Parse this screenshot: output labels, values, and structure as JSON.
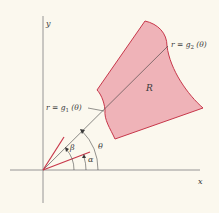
{
  "diagram": {
    "type": "polar-region",
    "colors": {
      "background": "#fbf8ee",
      "region_fill": "#efb3b8",
      "region_stroke": "#c7374a",
      "axis": "#8a8a8a",
      "ray": "#3a3a3a",
      "bound_ray": "#c7374a",
      "text": "#3a3a3a"
    },
    "axes": {
      "x_label": "x",
      "y_label": "y"
    },
    "region": {
      "label": "R"
    },
    "curves": {
      "inner": {
        "label_prefix": "r = g",
        "subscript": "1",
        "label_suffix": "(θ)"
      },
      "outer": {
        "label_prefix": "r = g",
        "subscript": "2",
        "label_suffix": "(θ)"
      }
    },
    "angles": {
      "alpha": "α",
      "beta": "β",
      "theta": "θ"
    }
  }
}
